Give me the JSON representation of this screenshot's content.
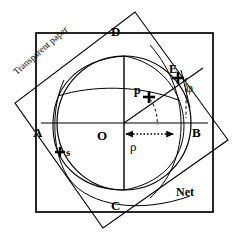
{
  "figure": {
    "colors": {
      "ink": "#000000",
      "background": "#ffffff",
      "thin_line": "#333333"
    },
    "labels": {
      "point_d": "D",
      "point_c": "C",
      "point_a": "A",
      "point_b": "B",
      "point_o": "O",
      "point_e": "E",
      "point_p": "p",
      "point_s": "s",
      "angle_phi": "φ",
      "radius_rho": "ρ",
      "net": "Net",
      "transparent_paper": "Transparent paper"
    },
    "geometry": {
      "outer_square": {
        "x": 36,
        "y": 33,
        "width": 177,
        "height": 179
      },
      "rotated_square": {
        "corner_top": [
          135,
          12
        ],
        "corner_right": [
          228,
          140
        ],
        "corner_bottom": [
          103,
          228
        ],
        "corner_left": [
          15,
          103
        ],
        "rotation_deg": -41
      },
      "main_circle": {
        "center": [
          124,
          123
        ],
        "radius": 67
      },
      "center_point": "O",
      "axis_horizontal": "A-B",
      "axis_vertical": "D-C",
      "marked_points": [
        "p",
        "E",
        "s"
      ],
      "rho_arrow": {
        "from": [
          124,
          134
        ],
        "to": [
          176,
          134
        ],
        "style": "dotted-double-arrow"
      }
    }
  }
}
